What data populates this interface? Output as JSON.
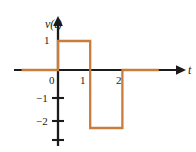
{
  "figure": {
    "axis_color": "#1b1b1b",
    "curve_color": "#c87d3c",
    "background": "#ffffff",
    "y_axis_label": "v(t)",
    "x_axis_label": "t",
    "x_tick_labels": [
      "0",
      "1",
      "2"
    ],
    "y_tick_labels": [
      "1",
      "−1",
      "−2"
    ]
  },
  "chart_data": {
    "type": "line",
    "title": "",
    "xlabel": "t",
    "ylabel": "v(t)",
    "xlim": [
      -1.3,
      3.9
    ],
    "ylim": [
      -2.9,
      1.9
    ],
    "xticks": [
      0,
      1,
      2
    ],
    "xtick_labels": [
      "0",
      "1",
      "2"
    ],
    "yticks": [
      1,
      -1,
      -2
    ],
    "ytick_labels": [
      "1",
      "−1",
      "−2"
    ],
    "grid": false,
    "legend": null,
    "series": [
      {
        "name": "v(t)",
        "color": "#c87d3c",
        "step": "post",
        "x": [
          -1.3,
          0,
          0,
          1.15,
          1.15,
          2.3,
          2.3,
          3.6
        ],
        "y": [
          0,
          0,
          1,
          1,
          -2,
          -2,
          0,
          0
        ]
      }
    ],
    "segments": [
      {
        "description": "zero level left of origin",
        "t_start": -1.3,
        "t_end": 0,
        "value": 0
      },
      {
        "description": "positive pulse",
        "t_start": 0,
        "t_end": 1.15,
        "value": 1
      },
      {
        "description": "negative pulse",
        "t_start": 1.15,
        "t_end": 2.3,
        "value": -2
      },
      {
        "description": "zero level right",
        "t_start": 2.3,
        "t_end": 3.6,
        "value": 0
      }
    ]
  }
}
